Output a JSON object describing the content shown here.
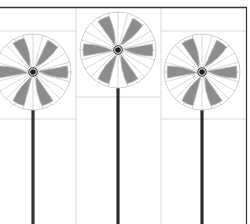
{
  "scene": {
    "description": "three pinwheels on poles",
    "width": 250,
    "height": 224,
    "background": "#ffffff"
  },
  "colors": {
    "frame": "#333333",
    "grid": "#d6d6d6",
    "blade_fill": "#8c8c8c",
    "blade_edge": "#b8b8b8",
    "spoke": "#bdbdbd",
    "rim": "#c8c8c8",
    "pole": "#2f2f2f",
    "hub": "#1e1e1e"
  },
  "pinwheels": [
    {
      "id": "left",
      "cx": 33,
      "cy": 72,
      "r": 38,
      "rotation": 0
    },
    {
      "id": "center",
      "cx": 118,
      "cy": 50,
      "r": 38,
      "rotation": 0
    },
    {
      "id": "right",
      "cx": 202,
      "cy": 72,
      "r": 38,
      "rotation": 0
    }
  ]
}
